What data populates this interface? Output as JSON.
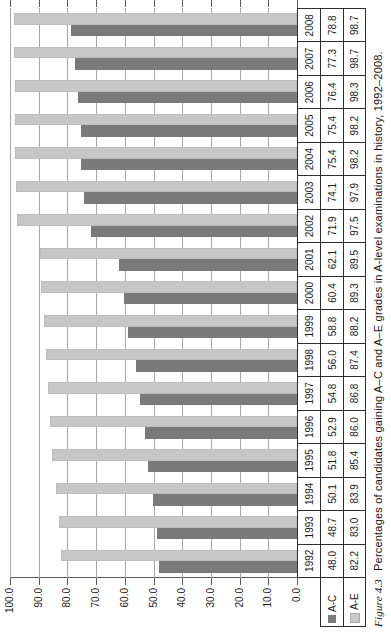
{
  "figure": {
    "caption_label": "Figure 4.3",
    "caption_text": "Percentages of candidates gaining A–C and A–E grades in A-level examinations in history, 1992–2008."
  },
  "chart_data": {
    "type": "bar",
    "orientation": "vertical-columns-rotated-90ccw-on-page",
    "title": "",
    "xlabel": "",
    "ylabel": "",
    "ylim": [
      0,
      100
    ],
    "ytick_interval": 10,
    "ytick_labels_top_to_bottom": [
      "100.0",
      "90.0",
      "80.0",
      "70.0",
      "60.0",
      "50.0",
      "40.0",
      "30.0",
      "20.0",
      "10.0",
      "0.0"
    ],
    "grid": true,
    "data_table_shown": true,
    "legend_position": "data-table-row-headers",
    "categories": [
      "1992",
      "1993",
      "1994",
      "1995",
      "1996",
      "1997",
      "1998",
      "1999",
      "2000",
      "2001",
      "2002",
      "2003",
      "2004",
      "2005",
      "2006",
      "2007",
      "2008"
    ],
    "series": [
      {
        "name": "A-C",
        "color": "#7a7a7a",
        "values": [
          48.0,
          48.7,
          50.1,
          51.8,
          52.9,
          54.8,
          56.0,
          58.8,
          60.4,
          62.1,
          71.9,
          74.1,
          75.4,
          75.4,
          76.4,
          77.3,
          78.8
        ]
      },
      {
        "name": "A-E",
        "color": "#c6c7c6",
        "values": [
          82.2,
          83.0,
          83.9,
          85.4,
          86.0,
          86.8,
          87.4,
          88.2,
          89.3,
          89.5,
          97.5,
          97.9,
          98.2,
          98.2,
          98.3,
          98.7,
          98.7
        ]
      }
    ],
    "colors": {
      "bar_dark": "#7a7a7a",
      "bar_light": "#c6c7c6",
      "gridline": "#a7a7a7",
      "axis": "#5a5a5a",
      "table_border": "#2e2e2e",
      "text": "#1b1b1b"
    }
  }
}
